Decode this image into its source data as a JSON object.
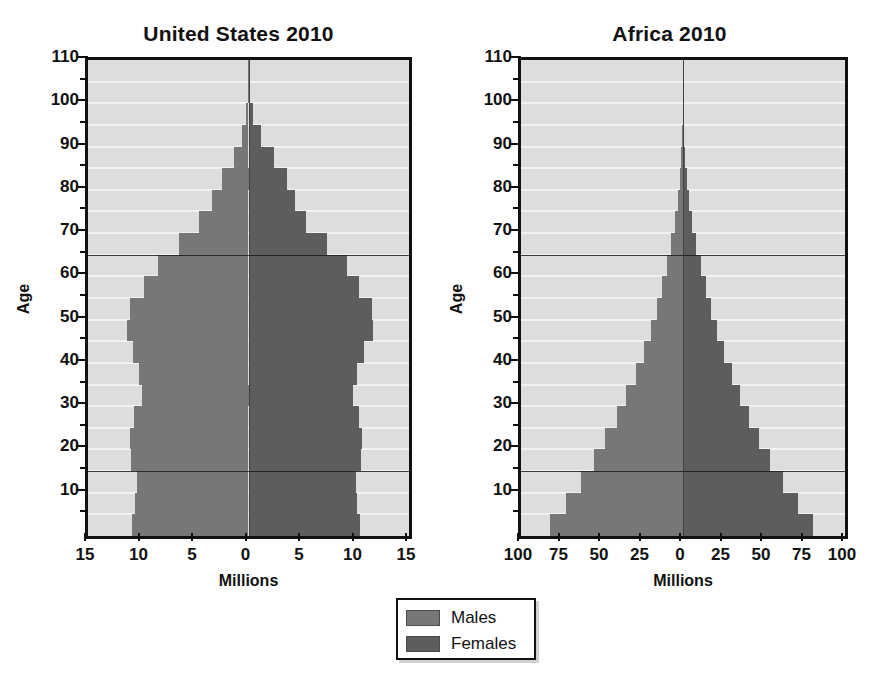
{
  "figure": {
    "type": "population-pyramid-pair",
    "background": "#ffffff"
  },
  "colors": {
    "males": "#777777",
    "females": "#5d5d5d",
    "plot_background": "#dddddd",
    "gridline": "#f2f2f2",
    "axis": "#111111"
  },
  "legend": {
    "items": [
      {
        "label": "Males",
        "color": "#777777"
      },
      {
        "label": "Females",
        "color": "#5d5d5d"
      }
    ]
  },
  "axis_titles": {
    "x": "Millions",
    "y": "Age"
  },
  "y_ticks": [
    110,
    100,
    90,
    80,
    70,
    60,
    50,
    40,
    30,
    20,
    10
  ],
  "y_minor_ticks": [
    105,
    95,
    85,
    75,
    65,
    55,
    45,
    35,
    25,
    15,
    5
  ],
  "chart_data": [
    {
      "type": "bar",
      "orientation": "horizontal",
      "layout": "population-pyramid",
      "title": "United States 2010",
      "xlabel": "Millions",
      "ylabel": "Age",
      "xtick_labels": [
        "15",
        "10",
        "5",
        "0",
        "5",
        "10",
        "15"
      ],
      "xtick_values": [
        -15,
        -10,
        -5,
        0,
        5,
        10,
        15
      ],
      "xlim": [
        -15,
        15
      ],
      "ylim": [
        0,
        110
      ],
      "grid": true,
      "legend_position": "below-center",
      "age_groups": [
        "0-4",
        "5-9",
        "10-14",
        "15-19",
        "20-24",
        "25-29",
        "30-34",
        "35-39",
        "40-44",
        "45-49",
        "50-54",
        "55-59",
        "60-64",
        "65-69",
        "70-74",
        "75-79",
        "80-84",
        "85-89",
        "90-94",
        "95-99",
        "100-104",
        "105-109"
      ],
      "series": [
        {
          "name": "Males",
          "values": [
            10.9,
            10.6,
            10.4,
            11.0,
            11.1,
            10.7,
            10.0,
            10.2,
            10.8,
            11.4,
            11.1,
            9.8,
            8.5,
            6.5,
            4.6,
            3.4,
            2.5,
            1.4,
            0.6,
            0.2,
            0.05,
            0.01
          ]
        },
        {
          "name": "Females",
          "values": [
            10.4,
            10.1,
            10.0,
            10.5,
            10.6,
            10.3,
            9.8,
            10.1,
            10.8,
            11.6,
            11.5,
            10.3,
            9.2,
            7.3,
            5.4,
            4.3,
            3.6,
            2.4,
            1.2,
            0.4,
            0.1,
            0.02
          ]
        }
      ],
      "reference_lines": [
        {
          "age": 15,
          "label": "youth dependency boundary"
        },
        {
          "age": 65,
          "label": "old-age dependency boundary"
        }
      ]
    },
    {
      "type": "bar",
      "orientation": "horizontal",
      "layout": "population-pyramid",
      "title": "Africa 2010",
      "xlabel": "Millions",
      "ylabel": "Age",
      "xtick_labels": [
        "100",
        "75",
        "50",
        "25",
        "0",
        "25",
        "50",
        "75",
        "100"
      ],
      "xtick_values": [
        -100,
        -75,
        -50,
        -25,
        0,
        25,
        50,
        75,
        100
      ],
      "xlim": [
        -100,
        100
      ],
      "ylim": [
        0,
        110
      ],
      "grid": true,
      "legend_position": "below-center",
      "age_groups": [
        "0-4",
        "5-9",
        "10-14",
        "15-19",
        "20-24",
        "25-29",
        "30-34",
        "35-39",
        "40-44",
        "45-49",
        "50-54",
        "55-59",
        "60-64",
        "65-69",
        "70-74",
        "75-79",
        "80-84",
        "85-89",
        "90-94",
        "95-99",
        "100-104",
        "105-109"
      ],
      "series": [
        {
          "name": "Males",
          "values": [
            82,
            72,
            63,
            55,
            48,
            41,
            35,
            29,
            24,
            20,
            16,
            13,
            10,
            7.2,
            5.0,
            3.2,
            1.9,
            1.0,
            0.4,
            0.12,
            0.03,
            0.008
          ]
        },
        {
          "name": "Females",
          "values": [
            80,
            71,
            62,
            54,
            47,
            41,
            35,
            30,
            25,
            21,
            17,
            14,
            11,
            8.0,
            5.7,
            3.7,
            2.2,
            1.2,
            0.5,
            0.15,
            0.04,
            0.01
          ]
        }
      ],
      "reference_lines": [
        {
          "age": 15,
          "label": "youth dependency boundary"
        },
        {
          "age": 65,
          "label": "old-age dependency boundary"
        }
      ]
    }
  ]
}
